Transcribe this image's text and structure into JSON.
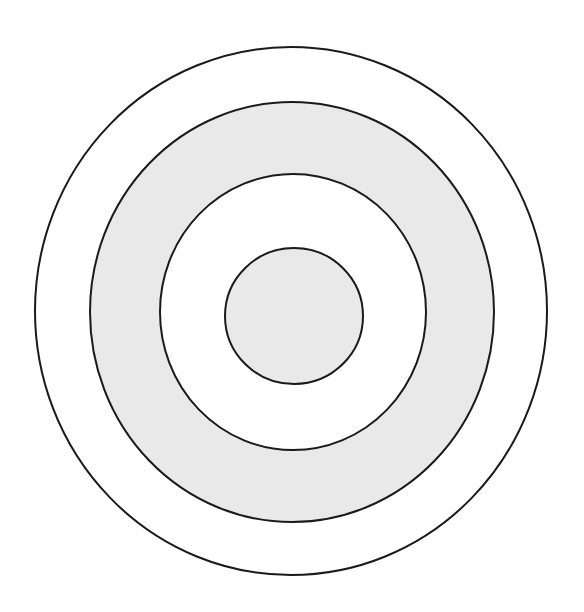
{
  "diagram": {
    "type": "concentric-circles",
    "canvas": {
      "width": 584,
      "height": 612,
      "background": "#ffffff"
    },
    "stroke_color": "#1a1a1a",
    "stroke_width": 2,
    "colors": {
      "shaded": "#e9e9e9",
      "unshaded": "#ffffff"
    },
    "rings": [
      {
        "id": "outer",
        "cx": 291,
        "cy": 311,
        "rx": 256,
        "ry": 264,
        "fill": "#ffffff"
      },
      {
        "id": "second",
        "cx": 292,
        "cy": 312,
        "rx": 202,
        "ry": 210,
        "fill": "#e9e9e9"
      },
      {
        "id": "third",
        "cx": 293,
        "cy": 312,
        "rx": 133,
        "ry": 138,
        "fill": "#ffffff"
      },
      {
        "id": "inner",
        "cx": 294,
        "cy": 316,
        "rx": 69,
        "ry": 68,
        "fill": "#e9e9e9"
      }
    ]
  }
}
